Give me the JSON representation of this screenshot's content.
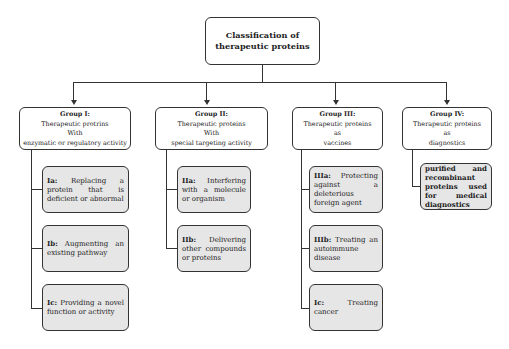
{
  "diagram": {
    "root": {
      "title": "Classification of therapeutic proteins"
    },
    "groups": [
      {
        "label": "Group I:",
        "line1": "Therapeutic protrins",
        "line2": "With",
        "line3": "enzymatic or regulatory activity",
        "children": [
          {
            "code": "Ia:",
            "text": " Replacing a protein that is deficient or abnormal"
          },
          {
            "code": "Ib:",
            "text": " Augmenting an existing pathway"
          },
          {
            "code": "Ic:",
            "text": " Providing a novel function or activity"
          }
        ]
      },
      {
        "label": "Group II:",
        "line1": "Therapeutic proteins",
        "line2": "With",
        "line3": "special targeting activity",
        "children": [
          {
            "code": "IIa:",
            "text": " Interfering with a molecule or organism"
          },
          {
            "code": "IIb:",
            "text": " Delivering other compounds or proteins"
          }
        ]
      },
      {
        "label": "Group III:",
        "line1": "Therapeutic proteins",
        "line2": "as",
        "line3": "vaccines",
        "children": [
          {
            "code": "IIIa:",
            "text": " Protecting against a deleterious foreign agent"
          },
          {
            "code": "IIIb:",
            "text": " Treating an autoimmune disease"
          },
          {
            "code": "Ic:",
            "text": " Treating cancer"
          }
        ]
      },
      {
        "label": "Group IV:",
        "line1": "Therapeutic proteins",
        "line2": "as",
        "line3": "diagnostics",
        "children": [
          {
            "code": "",
            "text": "purified and recombinant proteins used for medical diagnostics"
          }
        ]
      }
    ]
  }
}
